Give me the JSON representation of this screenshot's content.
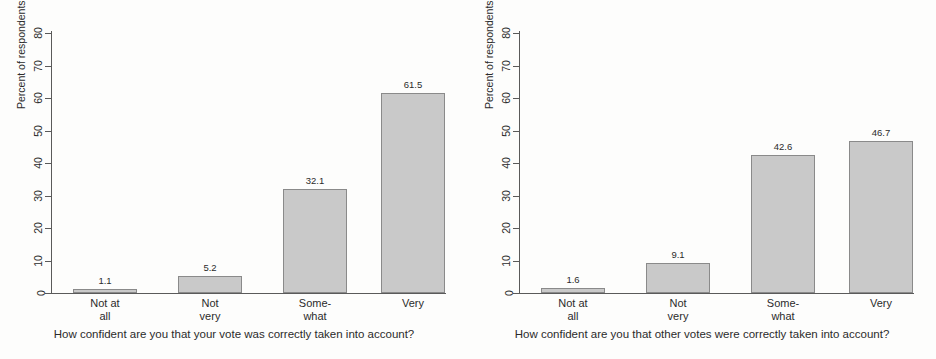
{
  "figure": {
    "background_color": "#fdfdfc",
    "bar_fill_color": "#c9c9c9",
    "bar_border_color": "#8a8a8a",
    "axis_color": "#5a5a5a",
    "text_color": "#2b2b2b"
  },
  "chart_data": [
    {
      "type": "bar",
      "panel": "left",
      "title": "",
      "xlabel": "How confident are you that your vote was correctly taken into account?",
      "ylabel": "Percent of respondents",
      "categories": [
        "Not at all",
        "Not very",
        "Some-what",
        "Very"
      ],
      "category_lines": [
        [
          "Not at",
          "all"
        ],
        [
          "Not",
          "very"
        ],
        [
          "Some-",
          "what"
        ],
        [
          "Very"
        ]
      ],
      "values": [
        1.1,
        5.2,
        32.1,
        61.5
      ],
      "value_labels": [
        "1.1",
        "5.2",
        "32.1",
        "61.5"
      ],
      "ylim": [
        0,
        80
      ],
      "yticks": [
        0,
        10,
        20,
        30,
        40,
        50,
        60,
        70,
        80
      ],
      "ytick_labels": [
        "0",
        "10",
        "20",
        "30",
        "40",
        "50",
        "60",
        "70",
        "80"
      ],
      "grid": false,
      "legend": "none"
    },
    {
      "type": "bar",
      "panel": "right",
      "title": "",
      "xlabel": "How confident are you that other votes were correctly taken into account?",
      "ylabel": "Percent of respondents",
      "categories": [
        "Not at all",
        "Not very",
        "Some-what",
        "Very"
      ],
      "category_lines": [
        [
          "Not at",
          "all"
        ],
        [
          "Not",
          "very"
        ],
        [
          "Some-",
          "what"
        ],
        [
          "Very"
        ]
      ],
      "values": [
        1.6,
        9.1,
        42.6,
        46.7
      ],
      "value_labels": [
        "1.6",
        "9.1",
        "42.6",
        "46.7"
      ],
      "ylim": [
        0,
        80
      ],
      "yticks": [
        0,
        10,
        20,
        30,
        40,
        50,
        60,
        70,
        80
      ],
      "ytick_labels": [
        "0",
        "10",
        "20",
        "30",
        "40",
        "50",
        "60",
        "70",
        "80"
      ],
      "grid": false,
      "legend": "none"
    }
  ]
}
